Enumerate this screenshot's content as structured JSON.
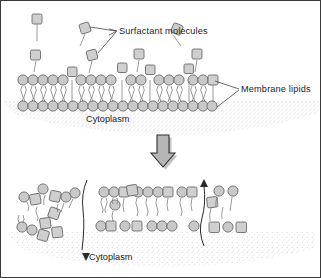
{
  "figure": {
    "width": 321,
    "height": 278,
    "background_color": "#ffffff",
    "border_color": "#3a3a3a"
  },
  "labels": {
    "surfactant": "Surfactant  molecules",
    "membrane_lipids": "Membrane lipids",
    "cytoplasm_top": "Cytoplasm",
    "cytoplasm_bottom": "Cytoplasm"
  },
  "colors": {
    "head_fill": "#c9c9c9",
    "square_fill": "#cfcfcf",
    "outline": "#5d5d5d",
    "tail_stroke": "#6f6f6f",
    "leader_stroke": "#3c3c3c",
    "arrow_fill": "#b6b6b6",
    "arrow_outline": "#2f2f2f",
    "cytoplasm_stipple": "#bdbdbd",
    "text": "#1d1d1d"
  },
  "panels": {
    "top": {
      "name": "intact-membrane-panel",
      "description": "Intact lipid bilayer with surfactant molecules approaching and inserting into the outer leaflet",
      "membrane_y_outer": 78,
      "membrane_y_inner": 100,
      "lipid_head_count_outer": 26,
      "lipid_head_count_inner": 26
    },
    "bottom": {
      "name": "solubilized-membrane-panel",
      "description": "Disrupted membrane: mixed lipid-surfactant micelles form and lipids are extracted from the bilayer",
      "membrane_y_outer": 212,
      "membrane_y_inner": 232
    }
  },
  "icons": {
    "surfactant": "square-head-single-tail-icon",
    "lipid": "circle-head-double-tail-icon",
    "transition": "down-block-arrow-icon",
    "flow_down": "curved-down-arrow-icon",
    "flow_up": "curved-up-arrow-icon"
  }
}
